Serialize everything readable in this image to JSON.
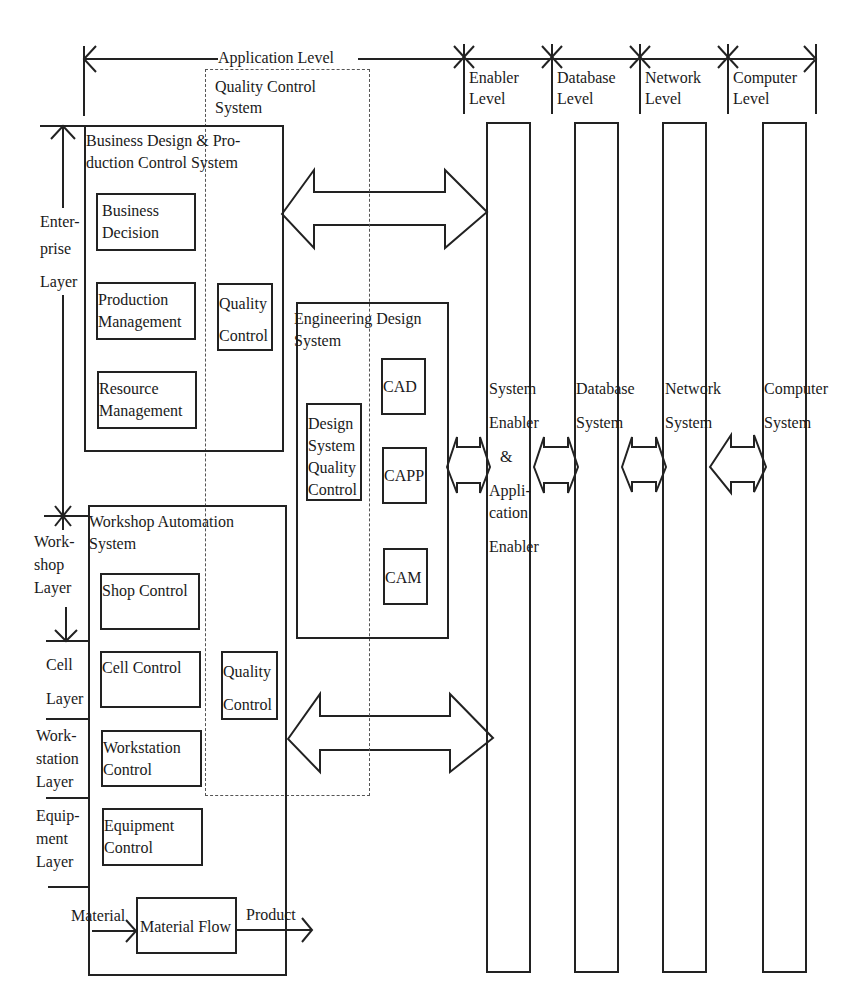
{
  "levels": {
    "application": "Application Level",
    "enabler": [
      "Enabler",
      "Level"
    ],
    "database": [
      "Database",
      "Level"
    ],
    "network": [
      "Network",
      "Level"
    ],
    "computer": [
      "Computer",
      "Level"
    ]
  },
  "quality_control_system": [
    "Quality Control",
    "System"
  ],
  "layers": {
    "enterprise": [
      "Enter-",
      "prise",
      "Layer"
    ],
    "workshop": [
      "Work-",
      "shop",
      "Layer"
    ],
    "cell": [
      "Cell",
      "Layer"
    ],
    "workstation": [
      "Work-",
      "station",
      "Layer"
    ],
    "equipment": [
      "Equip-",
      "ment",
      "Layer"
    ]
  },
  "business_system": {
    "title": [
      "Business Design & Pro-",
      "duction  Control  System"
    ],
    "modules": [
      [
        "Business",
        "Decision"
      ],
      [
        "Production",
        "Management"
      ],
      [
        "Resource",
        "Management"
      ]
    ],
    "quality_control": [
      "Quality",
      "Control"
    ]
  },
  "engineering_system": {
    "title": [
      "Engineering Design",
      "System"
    ],
    "quality_control": [
      "Design",
      "System",
      "Quality",
      "Control"
    ],
    "modules": [
      "CAD",
      "CAPP",
      "CAM"
    ]
  },
  "workshop_system": {
    "title": [
      "Workshop Automation",
      "System"
    ],
    "modules": [
      [
        "Shop Control"
      ],
      [
        "Cell Control"
      ],
      [
        "Workstation",
        "Control"
      ],
      [
        "Equipment",
        "Control"
      ]
    ],
    "quality_control": [
      "Quality",
      "Control"
    ],
    "material_flow": "Material Flow",
    "input_label": "Material",
    "output_label": "Product"
  },
  "infrastructure_columns": [
    {
      "id": "enabler",
      "label": [
        "System",
        "Enabler",
        "&",
        "Appli-",
        "cation",
        "Enabler"
      ]
    },
    {
      "id": "database",
      "label": [
        "Database",
        "System"
      ]
    },
    {
      "id": "network",
      "label": [
        "Network",
        "System"
      ]
    },
    {
      "id": "computer",
      "label": [
        "Computer",
        "System"
      ]
    }
  ],
  "colors": {
    "line": "#222222",
    "dashed": "#555555",
    "background": "#ffffff"
  }
}
